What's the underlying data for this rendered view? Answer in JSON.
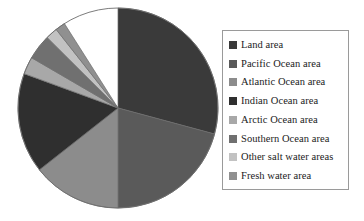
{
  "chart_data": {
    "type": "pie",
    "title": "",
    "subtitle": "",
    "xlabel": "",
    "ylabel": "",
    "grid": false,
    "legend_position": "right",
    "start_angle_deg": 0,
    "direction": "clockwise",
    "categories": [
      "Land area",
      "Pacific Ocean area",
      "Atlantic Ocean area",
      "Indian Ocean area",
      "Arctic Ocean area",
      "Southern Ocean area",
      "Other salt water areas",
      "Fresh water area"
    ],
    "values": [
      29.2,
      20.8,
      14.4,
      16.2,
      2.8,
      4.1,
      1.9,
      1.6
    ],
    "units": "percent of Earth surface",
    "colors": [
      "#3a3a3a",
      "#5a5a5a",
      "#8c8c8c",
      "#2f2f2f",
      "#a8a8a8",
      "#707070",
      "#c2c2c2",
      "#909090"
    ],
    "slice_angles_deg": [
      {
        "start": 0,
        "end": 105.1
      },
      {
        "start": 105.1,
        "end": 180.0
      },
      {
        "start": 180.0,
        "end": 231.8
      },
      {
        "start": 231.8,
        "end": 290.1
      },
      {
        "start": 290.1,
        "end": 300.2
      },
      {
        "start": 300.2,
        "end": 314.9
      },
      {
        "start": 314.9,
        "end": 321.8
      },
      {
        "start": 321.8,
        "end": 327.6
      }
    ]
  },
  "chart": {
    "center_x": 118,
    "center_y": 108,
    "radius": 100,
    "outline_color": "#6d6d6d"
  },
  "legend": {
    "border_color": "#9a9a9a",
    "background": "#ffffff",
    "items": [
      {
        "label": "Land area",
        "color": "#3a3a3a"
      },
      {
        "label": "Pacific Ocean area",
        "color": "#5a5a5a"
      },
      {
        "label": "Atlantic Ocean area",
        "color": "#8c8c8c"
      },
      {
        "label": " Indian Ocean area",
        "color": "#2f2f2f"
      },
      {
        "label": "Arctic Ocean area",
        "color": "#a8a8a8"
      },
      {
        "label": "Southern Ocean area",
        "color": "#707070"
      },
      {
        "label": "Other salt water areas",
        "color": "#c2c2c2"
      },
      {
        "label": "Fresh water area",
        "color": "#909090"
      }
    ]
  }
}
